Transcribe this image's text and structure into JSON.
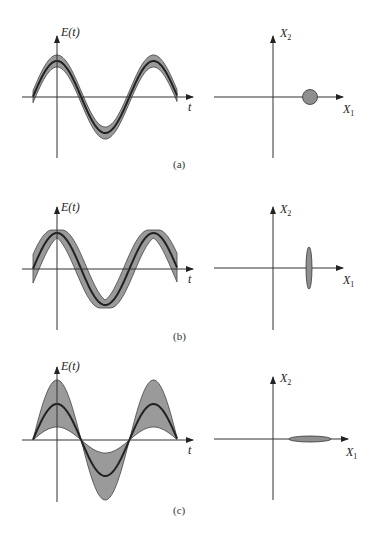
{
  "figure": {
    "panels": [
      {
        "id": "a",
        "label": "(a)",
        "time_plot": {
          "y_axis_label": "E(t)",
          "x_axis_label": "t",
          "band": "narrow uniform noise band"
        },
        "phase_plot": {
          "x_axis_label": "X",
          "x_axis_sub": "1",
          "y_axis_label": "X",
          "y_axis_sub": "2",
          "shape": "circle"
        }
      },
      {
        "id": "b",
        "label": "(b)",
        "time_plot": {
          "y_axis_label": "E(t)",
          "x_axis_label": "t",
          "band": "phase-noise band, widest at zero crossings"
        },
        "phase_plot": {
          "x_axis_label": "X",
          "x_axis_sub": "1",
          "y_axis_label": "X",
          "y_axis_sub": "2",
          "shape": "vertical ellipse"
        }
      },
      {
        "id": "c",
        "label": "(c)",
        "time_plot": {
          "y_axis_label": "E(t)",
          "x_axis_label": "t",
          "band": "amplitude-noise band, widest at peaks"
        },
        "phase_plot": {
          "x_axis_label": "X",
          "x_axis_sub": "1",
          "y_axis_label": "X",
          "y_axis_sub": "2",
          "shape": "horizontal ellipse"
        }
      }
    ]
  },
  "colors": {
    "band_fill": "#9a9a9a",
    "line": "#222222",
    "background": "#ffffff"
  }
}
